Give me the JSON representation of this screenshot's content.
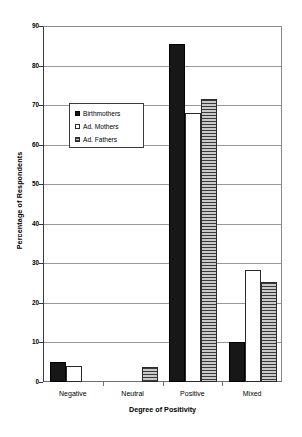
{
  "chart_data": {
    "type": "bar",
    "title": "",
    "xlabel": "Degree of Positivity",
    "ylabel": "Percentage of Respondents",
    "categories": [
      "Negative",
      "Neutral",
      "Positive",
      "Mixed"
    ],
    "series": [
      {
        "name": "Birthmothers",
        "key": "s-birthmothers",
        "fill": "solid-black",
        "color": "#171717",
        "values": [
          5,
          0,
          85.5,
          10
        ]
      },
      {
        "name": "Ad. Mothers",
        "key": "s-ad-mothers",
        "fill": "white-outline",
        "color": "#ffffff",
        "values": [
          4,
          0,
          68,
          28.3
        ]
      },
      {
        "name": "Ad. Fathers",
        "key": "s-ad-fathers",
        "fill": "gray-horizontal-hatch",
        "color": "#8e8e8e",
        "values": [
          0,
          3.7,
          71.5,
          25.2
        ]
      }
    ],
    "ylim": [
      0,
      90
    ],
    "ytick_step": 10,
    "yticks": [
      0,
      10,
      20,
      30,
      40,
      50,
      60,
      70,
      80,
      90
    ],
    "ytick_labels": [
      "0",
      "10",
      "20",
      "30",
      "40",
      "50",
      "60",
      "70",
      "80",
      "90"
    ],
    "grid": true,
    "grid_axis": "y",
    "legend_position": "upper-left-inside"
  },
  "legend": {
    "entries": [
      {
        "label": "Birthmothers"
      },
      {
        "label": "Ad. Mothers"
      },
      {
        "label": "Ad. Fathers"
      }
    ]
  }
}
